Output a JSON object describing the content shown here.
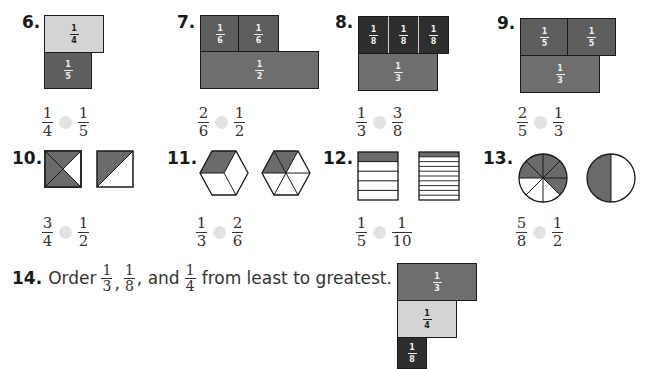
{
  "problems": [
    {
      "number": "6.",
      "bars_top": [
        {
          "num": "1",
          "den": "4",
          "shade": "light"
        }
      ],
      "bars_bottom": [
        {
          "num": "1",
          "den": "5",
          "shade": "dark"
        }
      ],
      "compare_left": {
        "num": "1",
        "den": "4"
      },
      "compare_right": {
        "num": "1",
        "den": "5"
      }
    },
    {
      "number": "7.",
      "bars_top": [
        {
          "num": "1",
          "den": "6"
        },
        {
          "num": "1",
          "den": "6"
        }
      ],
      "bars_bottom": [
        {
          "num": "1",
          "den": "2"
        }
      ],
      "compare_left": {
        "num": "2",
        "den": "6"
      },
      "compare_right": {
        "num": "1",
        "den": "2"
      }
    },
    {
      "number": "8.",
      "bars_top": [
        {
          "num": "1",
          "den": "8"
        },
        {
          "num": "1",
          "den": "8"
        },
        {
          "num": "1",
          "den": "8"
        }
      ],
      "bars_bottom": [
        {
          "num": "1",
          "den": "3"
        }
      ],
      "compare_left": {
        "num": "1",
        "den": "3"
      },
      "compare_right": {
        "num": "3",
        "den": "8"
      }
    },
    {
      "number": "9.",
      "bars_top": [
        {
          "num": "1",
          "den": "5"
        },
        {
          "num": "1",
          "den": "5"
        }
      ],
      "bars_bottom": [
        {
          "num": "1",
          "den": "3"
        }
      ],
      "compare_left": {
        "num": "2",
        "den": "5"
      },
      "compare_right": {
        "num": "1",
        "den": "3"
      }
    },
    {
      "number": "10.",
      "shape": "square",
      "left_shaded": "3/4",
      "right_shaded": "1/2",
      "compare_left": {
        "num": "3",
        "den": "4"
      },
      "compare_right": {
        "num": "1",
        "den": "2"
      }
    },
    {
      "number": "11.",
      "shape": "hexagon",
      "left_shaded": "1/3",
      "right_shaded": "2/6",
      "compare_left": {
        "num": "1",
        "den": "3"
      },
      "compare_right": {
        "num": "2",
        "den": "6"
      }
    },
    {
      "number": "12.",
      "shape": "rectangle-strips",
      "left_shaded": "1/5",
      "right_shaded": "1/10",
      "compare_left": {
        "num": "1",
        "den": "5"
      },
      "compare_right": {
        "num": "1",
        "den": "10"
      }
    },
    {
      "number": "13.",
      "shape": "circle",
      "left_shaded": "5/8",
      "right_shaded": "1/2",
      "compare_left": {
        "num": "5",
        "den": "8"
      },
      "compare_right": {
        "num": "1",
        "den": "2"
      }
    }
  ],
  "q14": {
    "number": "14.",
    "prefix": "Order",
    "f1": {
      "num": "1",
      "den": "3"
    },
    "sep1": ",",
    "f2": {
      "num": "1",
      "den": "8"
    },
    "sep2": ", and",
    "f3": {
      "num": "1",
      "den": "4"
    },
    "suffix": "from least to greatest.",
    "bars": [
      {
        "num": "1",
        "den": "3",
        "shade": "mid"
      },
      {
        "num": "1",
        "den": "4",
        "shade": "light"
      },
      {
        "num": "1",
        "den": "8",
        "shade": "vdark"
      }
    ]
  },
  "colors": {
    "light_bar": "#d4d4d4",
    "mid_bar": "#6e6e6e",
    "dark_bar": "#5e5e5e",
    "very_dark_bar": "#2e2e2e",
    "compare_dot": "#e2e2e2",
    "shape_fill": "#6a6a6a"
  }
}
